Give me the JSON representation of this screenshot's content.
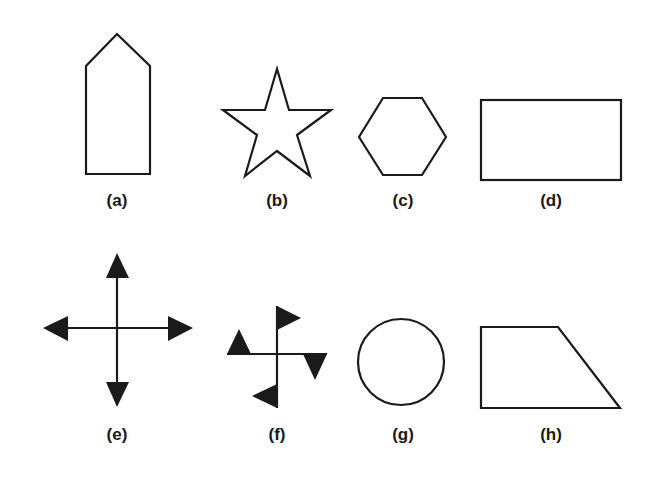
{
  "figure": {
    "stroke_color": "#1a1a1a",
    "background": "#ffffff",
    "panels": [
      {
        "id": "a",
        "label": "(a)",
        "shape": "pentagon-house (tall rectangle with pointed top)"
      },
      {
        "id": "b",
        "label": "(b)",
        "shape": "five-pointed star outline"
      },
      {
        "id": "c",
        "label": "(c)",
        "shape": "regular hexagon outline"
      },
      {
        "id": "d",
        "label": "(d)",
        "shape": "rectangle outline"
      },
      {
        "id": "e",
        "label": "(e)",
        "shape": "four-way cross with filled arrowheads"
      },
      {
        "id": "f",
        "label": "(f)",
        "shape": "pinwheel cross with filled flag triangles"
      },
      {
        "id": "g",
        "label": "(g)",
        "shape": "circle outline"
      },
      {
        "id": "h",
        "label": "(h)",
        "shape": "right trapezoid outline"
      }
    ]
  }
}
